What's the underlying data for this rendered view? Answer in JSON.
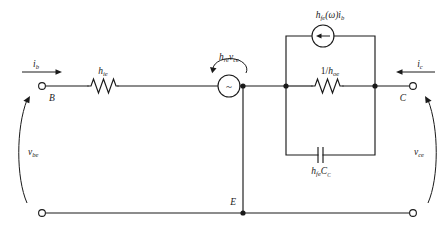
{
  "figure": {
    "type": "circuit-schematic",
    "background_color": "#ffffff",
    "line_color": "#1a1a1a"
  },
  "terminals": [
    {
      "id": "B",
      "label": "B",
      "name": "base-terminal"
    },
    {
      "id": "E",
      "label": "E",
      "name": "emitter-terminal"
    },
    {
      "id": "C",
      "label": "C",
      "name": "collector-terminal"
    }
  ],
  "currents": [
    {
      "id": "ib",
      "base": "i",
      "sub": "b",
      "direction": "right",
      "name": "base-current"
    },
    {
      "id": "ic",
      "base": "i",
      "sub": "c",
      "direction": "left",
      "name": "collector-current"
    }
  ],
  "voltages": [
    {
      "id": "vbe",
      "base": "v",
      "sub": "be",
      "side": "left",
      "name": "base-emitter-voltage"
    },
    {
      "id": "vce",
      "base": "v",
      "sub": "ce",
      "side": "right",
      "name": "collector-emitter-voltage"
    }
  ],
  "components": [
    {
      "id": "hie",
      "kind": "resistor",
      "base": "h",
      "sub": "ie",
      "name": "input-resistance-hie"
    },
    {
      "id": "hre_vce",
      "kind": "dependent-voltage-source",
      "symbol": "~",
      "base1": "h",
      "sub1": "re",
      "base2": "v",
      "sub2": "ce",
      "name": "dependent-voltage-source-hre-vce"
    },
    {
      "id": "hfe_w_ib",
      "kind": "dependent-current-source",
      "base1": "h",
      "sub1": "fe",
      "arg": "(ω)",
      "base2": "i",
      "sub2": "b",
      "arrow_direction": "left",
      "name": "dependent-current-source-hfe-ib"
    },
    {
      "id": "one_over_hoe",
      "kind": "resistor",
      "prefix": "1/",
      "base": "h",
      "sub": "oe",
      "name": "output-resistance-1-over-hoe"
    },
    {
      "id": "hfe_cc",
      "kind": "capacitor",
      "base1": "h",
      "sub1": "fe",
      "base2": "C",
      "sub2": "C",
      "name": "capacitor-hfe-cc"
    }
  ],
  "labels": {
    "ib": "i",
    "ib_sub": "b",
    "ic": "i",
    "ic_sub": "c",
    "vbe": "v",
    "vbe_sub": "be",
    "vce": "v",
    "vce_sub": "ce",
    "B": "B",
    "E": "E",
    "C": "C",
    "hie": "h",
    "hie_sub": "ie",
    "hre": "h",
    "hre_sub": "re",
    "vce_src": "v",
    "vce_src_sub": "ce",
    "hfe_top": "h",
    "hfe_top_sub": "fe",
    "omega_arg": "(ω)",
    "ib_src": "i",
    "ib_src_sub": "b",
    "hoe_prefix": "1/",
    "hoe": "h",
    "hoe_sub": "oe",
    "hfe_cap": "h",
    "hfe_cap_sub": "fe",
    "cc_cap": "C",
    "cc_cap_sub": "C",
    "sine_symbol": "~"
  }
}
